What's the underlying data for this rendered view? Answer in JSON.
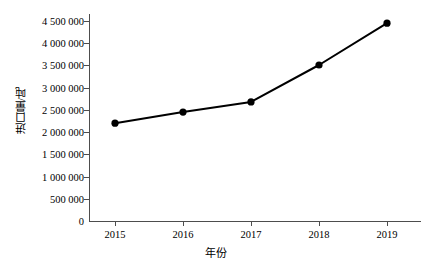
{
  "chart_data": {
    "type": "line",
    "title": "",
    "xlabel": "年份",
    "ylabel": "进口量/吨",
    "categories": [
      "2015",
      "2016",
      "2017",
      "2018",
      "2019"
    ],
    "x": [
      2015,
      2016,
      2017,
      2018,
      2019
    ],
    "values": [
      2200000,
      2450000,
      2680000,
      3510000,
      4450000
    ],
    "series": [
      {
        "name": "进口量",
        "values": [
          2200000,
          2450000,
          2680000,
          3510000,
          4450000
        ]
      }
    ],
    "ylim": [
      0,
      4500000
    ],
    "ytick_values": [
      0,
      500000,
      1000000,
      1500000,
      2000000,
      2500000,
      3000000,
      3500000,
      4000000,
      4500000
    ],
    "ytick_labels": [
      "0",
      "500 000",
      "1 000 000",
      "1 500 000",
      "2 000 000",
      "2 500 000",
      "3 000 000",
      "3 500 000",
      "4 000 000",
      "4 500 000"
    ],
    "xtick_labels": [
      "2015",
      "2016",
      "2017",
      "2018",
      "2019"
    ],
    "grid": false,
    "legend": false,
    "legend_position": "none",
    "marker": "filled-circle",
    "line_color": "#000000",
    "marker_color": "#000000",
    "axis_color": "#4d4d4d",
    "background_color": "#ffffff"
  }
}
